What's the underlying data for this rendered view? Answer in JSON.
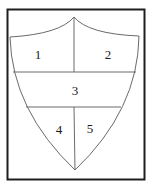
{
  "diagram": {
    "type": "shield-divided",
    "regions": [
      {
        "id": 1,
        "label": "1",
        "x": 38,
        "y": 59
      },
      {
        "id": 2,
        "label": "2",
        "x": 108,
        "y": 59
      },
      {
        "id": 3,
        "label": "3",
        "x": 75,
        "y": 95
      },
      {
        "id": 4,
        "label": "4",
        "x": 59,
        "y": 134
      },
      {
        "id": 5,
        "label": "5",
        "x": 90,
        "y": 133
      }
    ],
    "colors": {
      "frame": "#1e1e1e",
      "lines": "#6a6a6a",
      "text": "#1a1a1a",
      "background": "#ffffff"
    }
  }
}
